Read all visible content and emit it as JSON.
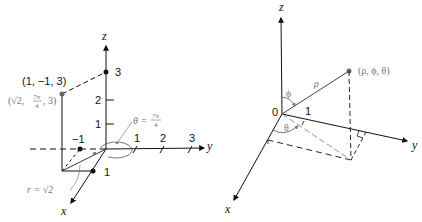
{
  "figures": [
    {
      "name": "cylindrical-coordinates-example",
      "axes": {
        "x_label": "x",
        "y_label": "y",
        "z_label": "z"
      },
      "z_ticks": [
        "1",
        "2",
        "3"
      ],
      "y_ticks": [
        "1",
        "2",
        "3"
      ],
      "x_tick": "1",
      "neg_y_tick": "−1",
      "point_cartesian": "(1, −1, 3)",
      "point_cylindrical_prefix": "(√2, ",
      "point_cylindrical_frac_num": "7π",
      "point_cylindrical_frac_den": "4",
      "point_cylindrical_suffix": ", 3)",
      "theta_label_prefix": "θ = ",
      "theta_frac_num": "7π",
      "theta_frac_den": "4",
      "r_label": "r = √2"
    },
    {
      "name": "spherical-coordinates-diagram",
      "axes": {
        "x_label": "x",
        "y_label": "y",
        "z_label": "z"
      },
      "origin_label": "0",
      "unit_label": "1",
      "rho_label": "ρ",
      "phi_label": "ϕ",
      "theta_label": "θ",
      "point_label": "(ρ, ϕ, θ)"
    }
  ],
  "colors": {
    "ink": "#111111",
    "grey": "#777777",
    "point_grey": "#666666"
  }
}
